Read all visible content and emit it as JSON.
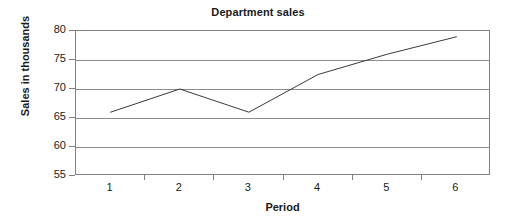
{
  "chart_data": {
    "type": "line",
    "title": "Department sales",
    "xlabel": "Period",
    "ylabel": "Sales in thousands",
    "categories": [
      "1",
      "2",
      "3",
      "4",
      "5",
      "6"
    ],
    "values": [
      66,
      70,
      66,
      72.5,
      76,
      79
    ],
    "series": [
      {
        "name": "Department sales",
        "values": [
          66,
          70,
          66,
          72.5,
          76,
          79
        ],
        "color": "#3a3a3a"
      }
    ],
    "ylim": [
      55,
      80
    ],
    "ytick_step": 5,
    "yticks": [
      "80",
      "75",
      "70",
      "65",
      "60",
      "55"
    ],
    "ytick_values": [
      80,
      75,
      70,
      65,
      60,
      55
    ],
    "xticks": [
      "1",
      "2",
      "3",
      "4",
      "5",
      "6"
    ],
    "grid": true,
    "grid_axis": "y",
    "legend": false,
    "markers": false,
    "plot_background": "#ffffff",
    "grid_color": "#8c8c8c",
    "axis_color": "#808080",
    "text_color": "#1a1a1a"
  }
}
